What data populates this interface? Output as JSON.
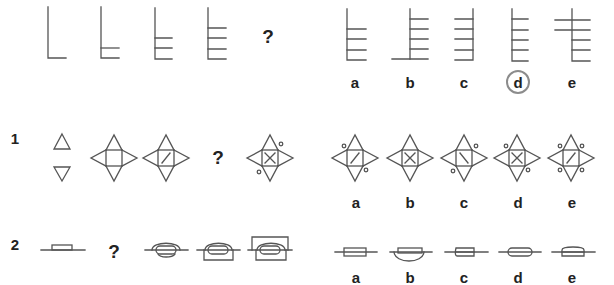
{
  "rows": [
    {
      "id": "example",
      "number": "",
      "question_mark": "?",
      "options": [
        {
          "label": "a",
          "selected": false
        },
        {
          "label": "b",
          "selected": false
        },
        {
          "label": "c",
          "selected": false
        },
        {
          "label": "d",
          "selected": true
        },
        {
          "label": "e",
          "selected": false
        }
      ]
    },
    {
      "id": "question-1",
      "number": "1",
      "question_mark": "?",
      "options": [
        {
          "label": "a",
          "selected": false
        },
        {
          "label": "b",
          "selected": false
        },
        {
          "label": "c",
          "selected": false
        },
        {
          "label": "d",
          "selected": false
        },
        {
          "label": "e",
          "selected": false
        }
      ]
    },
    {
      "id": "question-2",
      "number": "2",
      "question_mark": "?",
      "options": [
        {
          "label": "a",
          "selected": false
        },
        {
          "label": "b",
          "selected": false
        },
        {
          "label": "c",
          "selected": false
        },
        {
          "label": "d",
          "selected": false
        },
        {
          "label": "e",
          "selected": false
        }
      ]
    }
  ],
  "colors": {
    "stroke": "#555555",
    "text": "#222222",
    "selection_ring": "#8c8c8c"
  }
}
